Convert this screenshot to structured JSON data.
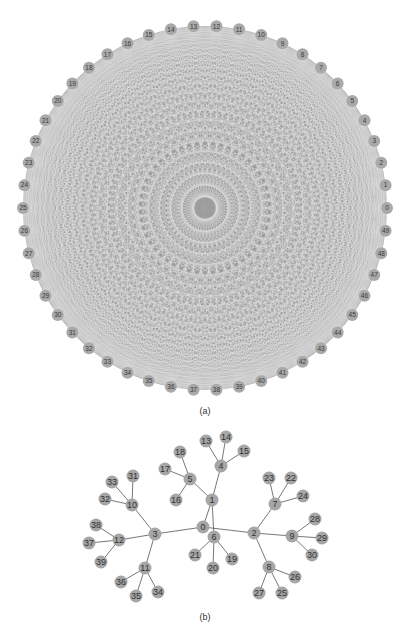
{
  "figure_a": {
    "caption": "(a)",
    "graph_type": "complete",
    "node_count": 50,
    "center": [
      205,
      208
    ],
    "radius": 182,
    "node_radius": 6,
    "start_angle_deg": 0,
    "direction": "counterclockwise",
    "labels": [
      "0",
      "1",
      "2",
      "3",
      "4",
      "5",
      "6",
      "7",
      "8",
      "9",
      "10",
      "11",
      "12",
      "13",
      "14",
      "15",
      "16",
      "17",
      "18",
      "19",
      "20",
      "21",
      "22",
      "23",
      "24",
      "25",
      "26",
      "27",
      "28",
      "29",
      "30",
      "31",
      "32",
      "33",
      "34",
      "35",
      "36",
      "37",
      "38",
      "39",
      "40",
      "41",
      "42",
      "43",
      "44",
      "45",
      "46",
      "47",
      "48",
      "49"
    ],
    "edge_color": "#8c8c8c",
    "node_color": "#a9a9a9"
  },
  "figure_b": {
    "caption": "(b)",
    "node_radius": 6.5,
    "node_color": "#a6a6a6",
    "edge_color": "#555555",
    "nodes": [
      {
        "id": "0",
        "x": 203,
        "y": 527
      },
      {
        "id": "1",
        "x": 212,
        "y": 500
      },
      {
        "id": "2",
        "x": 254,
        "y": 533
      },
      {
        "id": "3",
        "x": 155,
        "y": 534
      },
      {
        "id": "4",
        "x": 221,
        "y": 466
      },
      {
        "id": "5",
        "x": 190,
        "y": 479
      },
      {
        "id": "6",
        "x": 214,
        "y": 537
      },
      {
        "id": "7",
        "x": 275,
        "y": 504
      },
      {
        "id": "8",
        "x": 269,
        "y": 567
      },
      {
        "id": "9",
        "x": 292,
        "y": 536
      },
      {
        "id": "10",
        "x": 132,
        "y": 505
      },
      {
        "id": "11",
        "x": 145,
        "y": 568
      },
      {
        "id": "12",
        "x": 119,
        "y": 540
      },
      {
        "id": "13",
        "x": 206,
        "y": 441
      },
      {
        "id": "14",
        "x": 226,
        "y": 437
      },
      {
        "id": "15",
        "x": 244,
        "y": 451
      },
      {
        "id": "16",
        "x": 176,
        "y": 500
      },
      {
        "id": "17",
        "x": 165,
        "y": 469
      },
      {
        "id": "18",
        "x": 180,
        "y": 452
      },
      {
        "id": "19",
        "x": 232,
        "y": 559
      },
      {
        "id": "20",
        "x": 213,
        "y": 568
      },
      {
        "id": "21",
        "x": 195,
        "y": 555
      },
      {
        "id": "22",
        "x": 291,
        "y": 478
      },
      {
        "id": "23",
        "x": 269,
        "y": 478
      },
      {
        "id": "24",
        "x": 303,
        "y": 496
      },
      {
        "id": "25",
        "x": 282,
        "y": 593
      },
      {
        "id": "26",
        "x": 295,
        "y": 577
      },
      {
        "id": "27",
        "x": 259,
        "y": 593
      },
      {
        "id": "28",
        "x": 315,
        "y": 519
      },
      {
        "id": "29",
        "x": 322,
        "y": 538
      },
      {
        "id": "30",
        "x": 312,
        "y": 555
      },
      {
        "id": "31",
        "x": 133,
        "y": 476
      },
      {
        "id": "32",
        "x": 105,
        "y": 499
      },
      {
        "id": "33",
        "x": 112,
        "y": 482
      },
      {
        "id": "34",
        "x": 158,
        "y": 592
      },
      {
        "id": "35",
        "x": 136,
        "y": 596
      },
      {
        "id": "36",
        "x": 121,
        "y": 582
      },
      {
        "id": "37",
        "x": 89,
        "y": 543
      },
      {
        "id": "38",
        "x": 96,
        "y": 525
      },
      {
        "id": "39",
        "x": 101,
        "y": 562
      }
    ],
    "edges": [
      [
        "0",
        "1"
      ],
      [
        "0",
        "2"
      ],
      [
        "0",
        "3"
      ],
      [
        "1",
        "4"
      ],
      [
        "1",
        "5"
      ],
      [
        "1",
        "6"
      ],
      [
        "4",
        "13"
      ],
      [
        "4",
        "14"
      ],
      [
        "4",
        "15"
      ],
      [
        "5",
        "16"
      ],
      [
        "5",
        "17"
      ],
      [
        "5",
        "18"
      ],
      [
        "6",
        "19"
      ],
      [
        "6",
        "20"
      ],
      [
        "6",
        "21"
      ],
      [
        "2",
        "7"
      ],
      [
        "2",
        "8"
      ],
      [
        "2",
        "9"
      ],
      [
        "7",
        "22"
      ],
      [
        "7",
        "23"
      ],
      [
        "7",
        "24"
      ],
      [
        "8",
        "25"
      ],
      [
        "8",
        "26"
      ],
      [
        "8",
        "27"
      ],
      [
        "9",
        "28"
      ],
      [
        "9",
        "29"
      ],
      [
        "9",
        "30"
      ],
      [
        "3",
        "10"
      ],
      [
        "3",
        "11"
      ],
      [
        "3",
        "12"
      ],
      [
        "10",
        "31"
      ],
      [
        "10",
        "32"
      ],
      [
        "10",
        "33"
      ],
      [
        "11",
        "34"
      ],
      [
        "11",
        "35"
      ],
      [
        "11",
        "36"
      ],
      [
        "12",
        "37"
      ],
      [
        "12",
        "38"
      ],
      [
        "12",
        "39"
      ]
    ]
  }
}
